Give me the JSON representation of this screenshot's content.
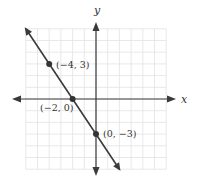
{
  "chart_data": {
    "type": "line",
    "title": "",
    "xlabel": "x",
    "ylabel": "y",
    "xlim": [
      -6,
      6
    ],
    "ylim": [
      -6,
      6
    ],
    "grid": true,
    "legend": null,
    "series": [
      {
        "name": "line",
        "equation": "y = -3/2 x - 3",
        "x": [
          -6,
          2
        ],
        "y": [
          6,
          -6
        ]
      }
    ],
    "points": [
      {
        "x": -4,
        "y": 3,
        "label": "(−4, 3)"
      },
      {
        "x": -2,
        "y": 0,
        "label": "(−2, 0)"
      },
      {
        "x": 0,
        "y": -3,
        "label": "(0, −3)"
      }
    ],
    "colors": {
      "grid": "#e2e2e2",
      "axis": "#3a3a3a",
      "line": "#3a3a3a",
      "point": "#333333"
    }
  },
  "labels": {
    "x_axis": "x",
    "y_axis": "y",
    "p1": "(−4, 3)",
    "p2": "(−2, 0)",
    "p3": "(0, −3)"
  }
}
